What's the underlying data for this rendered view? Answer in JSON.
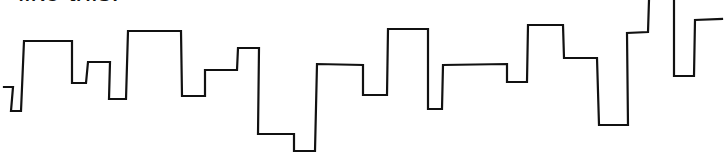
{
  "caption": {
    "text": "like this:"
  },
  "sketch": {
    "description": "hand-drawn step line",
    "stroke_color": "#111111",
    "segments": [
      {
        "name": "main-step-line",
        "points": [
          [
            4,
            87
          ],
          [
            13,
            87
          ],
          [
            11,
            111
          ],
          [
            21,
            111
          ],
          [
            24,
            41
          ],
          [
            72,
            41
          ],
          [
            72,
            83
          ],
          [
            86,
            83
          ],
          [
            88,
            62
          ],
          [
            110,
            62
          ],
          [
            109,
            99
          ],
          [
            126,
            99
          ],
          [
            128,
            31
          ],
          [
            181,
            31
          ],
          [
            182,
            96
          ],
          [
            205,
            96
          ],
          [
            205,
            70
          ],
          [
            237,
            70
          ],
          [
            238,
            48
          ],
          [
            259,
            48
          ],
          [
            258,
            134
          ],
          [
            294,
            134
          ],
          [
            294,
            151
          ],
          [
            315,
            151
          ],
          [
            317,
            64
          ],
          [
            363,
            65
          ],
          [
            363,
            95
          ],
          [
            387,
            95
          ],
          [
            388,
            29
          ],
          [
            428,
            29
          ],
          [
            428,
            109
          ],
          [
            442,
            109
          ],
          [
            443,
            65
          ],
          [
            507,
            64
          ],
          [
            507,
            82
          ],
          [
            527,
            82
          ],
          [
            528,
            25
          ],
          [
            563,
            25
          ],
          [
            564,
            58
          ],
          [
            597,
            58
          ],
          [
            599,
            125
          ],
          [
            628,
            125
          ],
          [
            627,
            33
          ],
          [
            648,
            32
          ],
          [
            649,
            0
          ]
        ]
      },
      {
        "name": "tail-step-line",
        "points": [
          [
            674,
            0
          ],
          [
            674,
            76
          ],
          [
            694,
            76
          ],
          [
            695,
            20
          ],
          [
            722,
            19
          ]
        ]
      }
    ]
  }
}
